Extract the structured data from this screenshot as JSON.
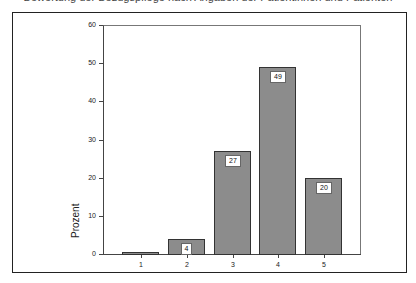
{
  "chart_data": {
    "type": "bar",
    "title": "",
    "xlabel": "",
    "ylabel": "Prozent",
    "categories": [
      "1",
      "2",
      "3",
      "4",
      "5"
    ],
    "values": [
      0.4,
      4,
      27,
      49,
      20
    ],
    "data_labels": [
      "",
      "4",
      "27",
      "49",
      "20"
    ],
    "ylim": [
      0,
      60
    ],
    "yticks": [
      0,
      10,
      20,
      30,
      40,
      50,
      60
    ],
    "grid": false,
    "legend": null,
    "bar_fill": "#8c8c8c",
    "bar_pattern": "dotted"
  },
  "header": {
    "cut_off_title": "Bewertung der Bezugspflege nach Angaben der Patientinnen und Patienten"
  }
}
